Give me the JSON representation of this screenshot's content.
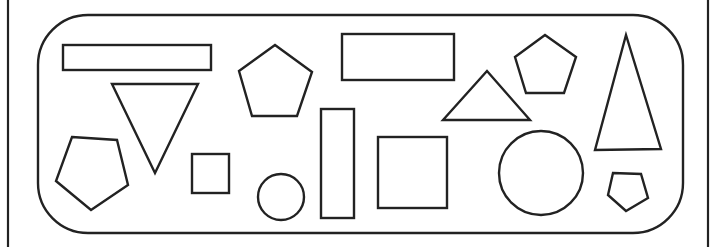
{
  "diagram": {
    "title": "",
    "stroke_color": "#222222",
    "background": "#ffffff",
    "frame": {
      "left_line_x": 8,
      "right_line_x": 708,
      "rounded_box": {
        "x": 38,
        "y": 15,
        "width": 645,
        "height": 218,
        "radius": 50
      }
    },
    "shapes": [
      {
        "id": "rect-long-top-left",
        "type": "rectangle",
        "x": 63,
        "y": 45,
        "width": 148,
        "height": 25
      },
      {
        "id": "triangle-inverted",
        "type": "triangle",
        "points": [
          [
            112,
            84
          ],
          [
            198,
            84
          ],
          [
            155,
            173
          ]
        ]
      },
      {
        "id": "pentagon-left",
        "type": "pentagon",
        "points": [
          [
            72,
            137
          ],
          [
            117,
            140
          ],
          [
            128,
            185
          ],
          [
            91,
            210
          ],
          [
            56,
            181
          ]
        ]
      },
      {
        "id": "pentagon-top-middle",
        "type": "pentagon",
        "points": [
          [
            275,
            45
          ],
          [
            312,
            72
          ],
          [
            297,
            116
          ],
          [
            252,
            116
          ],
          [
            239,
            71
          ]
        ]
      },
      {
        "id": "square-small",
        "type": "square",
        "x": 192,
        "y": 154,
        "width": 37,
        "height": 39
      },
      {
        "id": "circle-small",
        "type": "circle",
        "cx": 281,
        "cy": 197,
        "r": 23
      },
      {
        "id": "rect-tall",
        "type": "rectangle",
        "x": 321,
        "y": 109,
        "width": 33,
        "height": 109
      },
      {
        "id": "rect-upper-middle",
        "type": "rectangle",
        "x": 342,
        "y": 34,
        "width": 112,
        "height": 46
      },
      {
        "id": "square-middle",
        "type": "square",
        "x": 378,
        "y": 137,
        "width": 69,
        "height": 71
      },
      {
        "id": "triangle-wide",
        "type": "triangle",
        "points": [
          [
            487,
            71
          ],
          [
            443,
            120
          ],
          [
            530,
            120
          ]
        ]
      },
      {
        "id": "pentagon-top-right",
        "type": "pentagon",
        "points": [
          [
            545,
            35
          ],
          [
            576,
            57
          ],
          [
            564,
            93
          ],
          [
            526,
            93
          ],
          [
            515,
            57
          ]
        ]
      },
      {
        "id": "circle-large",
        "type": "circle",
        "cx": 541,
        "cy": 173,
        "r": 42
      },
      {
        "id": "triangle-tall",
        "type": "triangle",
        "points": [
          [
            626,
            35
          ],
          [
            595,
            150
          ],
          [
            661,
            149
          ]
        ]
      },
      {
        "id": "pentagon-small",
        "type": "pentagon",
        "points": [
          [
            613,
            173
          ],
          [
            641,
            174
          ],
          [
            648,
            198
          ],
          [
            626,
            211
          ],
          [
            608,
            195
          ]
        ]
      }
    ],
    "counts": {
      "rectangles": 3,
      "squares": 2,
      "triangles": 3,
      "pentagons": 4,
      "circles": 2
    }
  }
}
